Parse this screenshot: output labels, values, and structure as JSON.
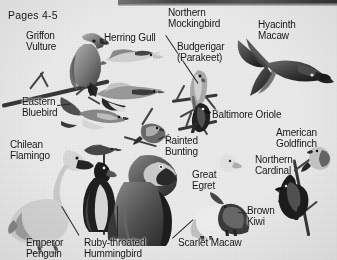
{
  "page": {
    "caption": "Pages 4-5",
    "background_color": "#edebe7",
    "text_color": "#17161a",
    "media": "grayscale scanned book spread of bird illustrations"
  },
  "labels": [
    {
      "id": "griffon-vulture",
      "text": "Griffon\nVulture",
      "x": 26,
      "y": 31
    },
    {
      "id": "herring-gull",
      "text": "Herring Gull",
      "x": 104,
      "y": 33
    },
    {
      "id": "northern-mockingbird",
      "text": "Northern\nMockingbird",
      "x": 168,
      "y": 8
    },
    {
      "id": "budgerigar-parakeet",
      "text": "Budgerigar\n(Parakeet)",
      "x": 177,
      "y": 42
    },
    {
      "id": "hyacinth-macaw",
      "text": "Hyacinth\nMacaw",
      "x": 258,
      "y": 20
    },
    {
      "id": "eastern-bluebird",
      "text": "Eastern\nBluebird",
      "x": 22,
      "y": 97
    },
    {
      "id": "baltimore-oriole",
      "text": "Baltimore Oriole",
      "x": 212,
      "y": 110
    },
    {
      "id": "chilean-flamingo",
      "text": "Chilean\nFlamingo",
      "x": 10,
      "y": 140
    },
    {
      "id": "painted-bunting",
      "text": "Painted\nBunting",
      "x": 165,
      "y": 136
    },
    {
      "id": "great-egret",
      "text": "Great\nEgret",
      "x": 192,
      "y": 170
    },
    {
      "id": "american-goldfinch",
      "text": "American\nGoldfinch",
      "x": 276,
      "y": 128
    },
    {
      "id": "northern-cardinal",
      "text": "Northern\nCardinal",
      "x": 255,
      "y": 155
    },
    {
      "id": "brown-kiwi",
      "text": "Brown\nKiwi",
      "x": 247,
      "y": 206
    },
    {
      "id": "emperor-penguin",
      "text": "Emperor\nPenguin",
      "x": 26,
      "y": 238
    },
    {
      "id": "ruby-throated-hummingbird",
      "text": "Ruby-throated\nHummingbird",
      "x": 84,
      "y": 238
    },
    {
      "id": "scarlet-macaw",
      "text": "Scarlet Macaw",
      "x": 178,
      "y": 238
    }
  ],
  "birds": [
    {
      "id": "griffon-vulture",
      "common_name": "Griffon Vulture"
    },
    {
      "id": "herring-gull",
      "common_name": "Herring Gull"
    },
    {
      "id": "northern-mockingbird",
      "common_name": "Northern Mockingbird"
    },
    {
      "id": "budgerigar",
      "common_name": "Budgerigar (Parakeet)"
    },
    {
      "id": "hyacinth-macaw",
      "common_name": "Hyacinth Macaw"
    },
    {
      "id": "eastern-bluebird",
      "common_name": "Eastern Bluebird"
    },
    {
      "id": "baltimore-oriole",
      "common_name": "Baltimore Oriole"
    },
    {
      "id": "chilean-flamingo",
      "common_name": "Chilean Flamingo"
    },
    {
      "id": "painted-bunting",
      "common_name": "Painted Bunting"
    },
    {
      "id": "great-egret",
      "common_name": "Great Egret"
    },
    {
      "id": "american-goldfinch",
      "common_name": "American Goldfinch"
    },
    {
      "id": "northern-cardinal",
      "common_name": "Northern Cardinal"
    },
    {
      "id": "brown-kiwi",
      "common_name": "Brown Kiwi"
    },
    {
      "id": "emperor-penguin",
      "common_name": "Emperor Penguin"
    },
    {
      "id": "ruby-throated-hummingbird",
      "common_name": "Ruby-throated Hummingbird"
    },
    {
      "id": "scarlet-macaw",
      "common_name": "Scarlet Macaw"
    }
  ]
}
